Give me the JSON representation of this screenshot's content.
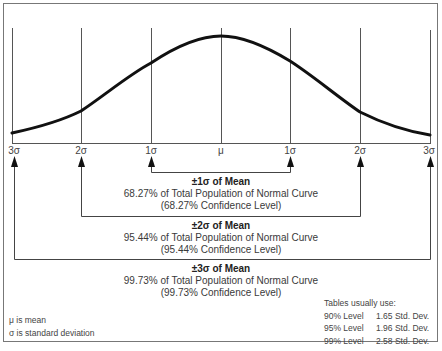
{
  "diagram": {
    "axis_ticks": [
      "3σ",
      "2σ",
      "1σ",
      "μ",
      "1σ",
      "2σ",
      "3σ"
    ],
    "ranges": [
      {
        "heading": "±1σ of Mean",
        "line1": "68.27% of Total Population of Normal Curve",
        "line2": "(68.27% Confidence Level)"
      },
      {
        "heading": "±2σ of Mean",
        "line1": "95.44% of Total Population of Normal Curve",
        "line2": "(95.44% Confidence Level)"
      },
      {
        "heading": "±3σ of Mean",
        "line1": "99.73% of Total Population of Normal Curve",
        "line2": "(99.73% Confidence Level)"
      }
    ],
    "legend": [
      "μ is mean",
      "σ is standard deviation"
    ],
    "table": {
      "heading": "Tables usually use:",
      "rows": [
        {
          "level": "90% Level",
          "value": "1.65 Std. Dev."
        },
        {
          "level": "95% Level",
          "value": "1.96 Std. Dev."
        },
        {
          "level": "99% Level",
          "value": "2.58 Std. Dev."
        }
      ]
    },
    "colors": {
      "curve": "#111111",
      "lines": "#555555",
      "border": "#666666"
    }
  }
}
